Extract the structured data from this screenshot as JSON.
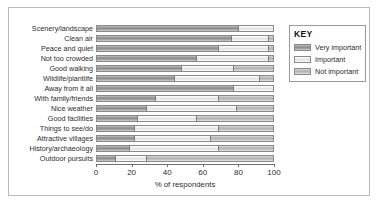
{
  "chart_data": {
    "type": "bar",
    "orientation": "horizontal",
    "stacked": true,
    "title": "",
    "xlabel": "% of respondents",
    "ylabel": "",
    "xlim": [
      0,
      100
    ],
    "xticks": [
      0,
      20,
      40,
      60,
      80,
      100
    ],
    "grid": false,
    "legend_position": "right",
    "legend_title": "KEY",
    "categories": [
      "Scenery/landscape",
      "Clean air",
      "Peace and quiet",
      "Not too crowded",
      "Good walking",
      "Wildlife/plantlife",
      "Away from it all",
      "With family/friends",
      "Nice weather",
      "Good facilities",
      "Things to see/do",
      "Attractive villages",
      "History/archaeology",
      "Outdoor pursuits"
    ],
    "series": [
      {
        "name": "Very important",
        "color": "#9a9a9a",
        "values": [
          80,
          76,
          69,
          56,
          48,
          44,
          77,
          33,
          28,
          23,
          21,
          21,
          18,
          10
        ]
      },
      {
        "name": "Important",
        "color": "#ededed",
        "values": [
          20,
          21,
          28,
          41,
          29,
          48,
          23,
          36,
          51,
          33,
          48,
          43,
          51,
          18
        ]
      },
      {
        "name": "Not important",
        "color": "#c0c0c0",
        "values": [
          0,
          3,
          3,
          3,
          23,
          8,
          0,
          31,
          21,
          44,
          31,
          36,
          31,
          72
        ]
      }
    ]
  },
  "legend": {
    "title": "KEY",
    "items": [
      {
        "label": "Very important"
      },
      {
        "label": "Important"
      },
      {
        "label": "Not important"
      }
    ]
  },
  "axis": {
    "x_title": "% of respondents",
    "ticks": [
      "0",
      "20",
      "40",
      "60",
      "80",
      "100"
    ]
  }
}
